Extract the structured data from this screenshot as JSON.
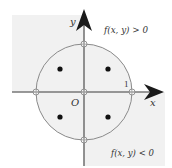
{
  "diagram": {
    "axes": {
      "x_label": "x",
      "y_label": "y",
      "origin_label": "O",
      "unit_tick_label": "1"
    },
    "annotations": {
      "positive_region": "f(x, y) > 0",
      "negative_region": "f(x, y) < 0"
    },
    "circle": {
      "center": [
        0,
        0
      ],
      "radius": 1
    },
    "intersection_points": [
      [
        1,
        0
      ],
      [
        0,
        1
      ],
      [
        -1,
        0
      ],
      [
        0,
        -1
      ],
      [
        0,
        0
      ]
    ],
    "critical_points": [
      [
        -0.7,
        0.7
      ],
      [
        0.7,
        0.7
      ],
      [
        -0.7,
        -0.7
      ],
      [
        0.7,
        -0.7
      ]
    ],
    "shaded_regions": [
      "outside circle, x<0, y>0",
      "inside circle, x>0, y>0",
      "inside circle, x<0, y<0",
      "outside circle, x>0, y<0"
    ],
    "colors": {
      "shade": "#f1f1f1",
      "axis": "#777777",
      "circle": "#8a8a8a",
      "arrow": "#1a1a1a",
      "dot": "#111111"
    }
  }
}
